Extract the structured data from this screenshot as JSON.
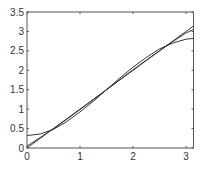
{
  "chart_data": {
    "type": "line",
    "title": "",
    "xlabel": "",
    "ylabel": "",
    "xlim": [
      0,
      3.1416
    ],
    "ylim": [
      0,
      3.5
    ],
    "grid": false,
    "legend": null,
    "x_ticks": [
      0,
      1,
      2,
      3
    ],
    "x_tick_labels": [
      "0",
      "1",
      "2",
      "3"
    ],
    "y_ticks": [
      0,
      0.5,
      1,
      1.5,
      2,
      2.5,
      3,
      3.5
    ],
    "y_tick_labels": [
      "0",
      "0.5",
      "1",
      "1.5",
      "2",
      "2.5",
      "3",
      "3.5"
    ],
    "x": [
      0,
      0.25,
      0.5,
      0.75,
      1.0,
      1.25,
      1.5,
      1.75,
      2.0,
      2.25,
      2.5,
      2.75,
      3.0,
      3.1416
    ],
    "series": [
      {
        "name": "line",
        "values": [
          0,
          0.25,
          0.5,
          0.75,
          1.0,
          1.25,
          1.5,
          1.75,
          2.0,
          2.25,
          2.5,
          2.75,
          3.0,
          3.14
        ]
      },
      {
        "name": "approx-1",
        "values": [
          0.32,
          0.36,
          0.48,
          0.68,
          0.93,
          1.2,
          1.5,
          1.8,
          2.08,
          2.33,
          2.55,
          2.7,
          2.8,
          2.82
        ]
      },
      {
        "name": "approx-2",
        "values": [
          0.05,
          0.27,
          0.5,
          0.74,
          0.99,
          1.24,
          1.5,
          1.76,
          2.01,
          2.26,
          2.5,
          2.74,
          2.96,
          3.05
        ]
      }
    ],
    "line_color": "#222222"
  }
}
